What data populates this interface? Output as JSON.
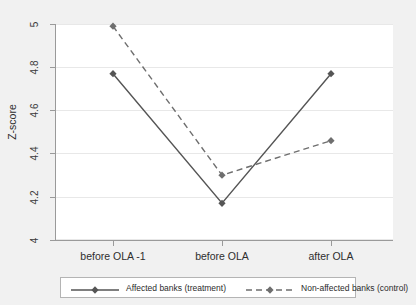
{
  "chart_data": {
    "type": "line",
    "title": "",
    "xlabel": "",
    "ylabel": "Z-score",
    "categories": [
      "before OLA -1",
      "before OLA",
      "after OLA"
    ],
    "series": [
      {
        "name": "Affected banks (treatment)",
        "values": [
          4.77,
          4.17,
          4.77
        ],
        "line_style": "solid",
        "marker": "diamond",
        "color": "#555555"
      },
      {
        "name": "Non-affected banks (control)",
        "values": [
          4.99,
          4.3,
          4.46
        ],
        "line_style": "dashed",
        "marker": "diamond",
        "color": "#6e6e6e"
      }
    ],
    "ylim": [
      4,
      5
    ],
    "yticks": [
      4,
      4.2,
      4.4,
      4.6,
      4.8,
      5
    ],
    "ytick_labels": [
      "4",
      "4.2",
      "4.4",
      "4.6",
      "4.8",
      "5"
    ],
    "grid": true,
    "grid_axis": "y",
    "legend_position": "bottom"
  },
  "axes": {
    "y_title": "Z-score",
    "y_tick_labels": [
      "5",
      "4.8",
      "4.6",
      "4.4",
      "4.2",
      "4"
    ],
    "x_tick_labels": [
      "before OLA -1",
      "before OLA",
      "after OLA"
    ]
  },
  "legend": {
    "entries": [
      {
        "label": "Affected banks (treatment)",
        "style": "solid-diamond"
      },
      {
        "label": "Non-affected banks (control)",
        "style": "dashed-diamond"
      }
    ]
  },
  "colors": {
    "figure_background": "#f1f1f1",
    "plot_background": "#ffffff",
    "gridline": "#e8e8e8",
    "axis": "#9a9a9a",
    "treatment_line": "#555555",
    "control_line": "#6e6e6e",
    "text": "#2e2e2e",
    "legend_border": "#b4b4b4"
  }
}
